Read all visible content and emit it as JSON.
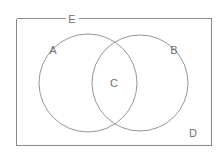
{
  "diagram": {
    "type": "venn",
    "background_color": "#ffffff",
    "stroke_color": "#8a8a8a",
    "label_color": "#6f6f6f",
    "canvas": {
      "width": 223,
      "height": 155
    },
    "universe": {
      "label": "E",
      "shape": "rectangle",
      "x": 16,
      "y": 18,
      "width": 195,
      "height": 127,
      "label_position": "top-edge-center-left",
      "label_x": 72,
      "label_y": 19,
      "label_breaks_border": true
    },
    "regions": [
      {
        "id": "set-a",
        "label": "A",
        "shape": "circle",
        "cx": 88,
        "cy": 83,
        "r": 49,
        "label_x": 53,
        "label_y": 50,
        "description": "left circle"
      },
      {
        "id": "set-b",
        "label": "B",
        "shape": "circle",
        "cx": 140,
        "cy": 83,
        "r": 48,
        "label_x": 174,
        "label_y": 50,
        "description": "right circle"
      },
      {
        "id": "intersection",
        "label": "C",
        "shape": "lens",
        "label_x": 114,
        "label_y": 83,
        "description": "overlap of A and B"
      },
      {
        "id": "complement",
        "label": "D",
        "shape": "region",
        "label_x": 193,
        "label_y": 133,
        "description": "region inside rectangle but outside both circles"
      }
    ],
    "labels": {
      "universe": "E",
      "left_set": "A",
      "right_set": "B",
      "intersection": "C",
      "outside": "D"
    }
  }
}
